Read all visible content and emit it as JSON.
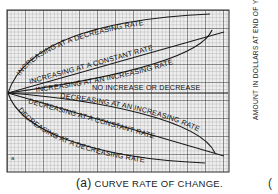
{
  "figure": {
    "caption_marker": "(a)",
    "caption_text": "CURVE RATE OF CHANGE.",
    "side_axis_label": "AMOUNT IN DOLLARS AT END OF YEAR",
    "side_partial_glyph": "(",
    "corner_mark": "a",
    "curves": [
      {
        "id": "increasing-decreasing-rate",
        "label": "INCREASING AT A DECREASING RATE"
      },
      {
        "id": "increasing-constant-rate",
        "label": "INCREASING AT A CONSTANT RATE"
      },
      {
        "id": "increasing-increasing-rate",
        "label": "INCREASING AT AN INCREASING RATE"
      },
      {
        "id": "no-change",
        "label": "NO INCREASE OR DECREASE"
      },
      {
        "id": "decreasing-increasing-rate",
        "label": "DECREASING AT AN INCREASING RATE"
      },
      {
        "id": "decreasing-constant-rate",
        "label": "DECREASING AT A CONSTANT RATE"
      },
      {
        "id": "decreasing-decreasing-rate",
        "label": "DECREASING AT A DECREASING RATE"
      }
    ],
    "colors": {
      "paper": "#f2f2f2",
      "grid_minor": "#9a9a9a",
      "grid_major": "#3a3a3a",
      "ink": "#1a1a1a"
    }
  }
}
